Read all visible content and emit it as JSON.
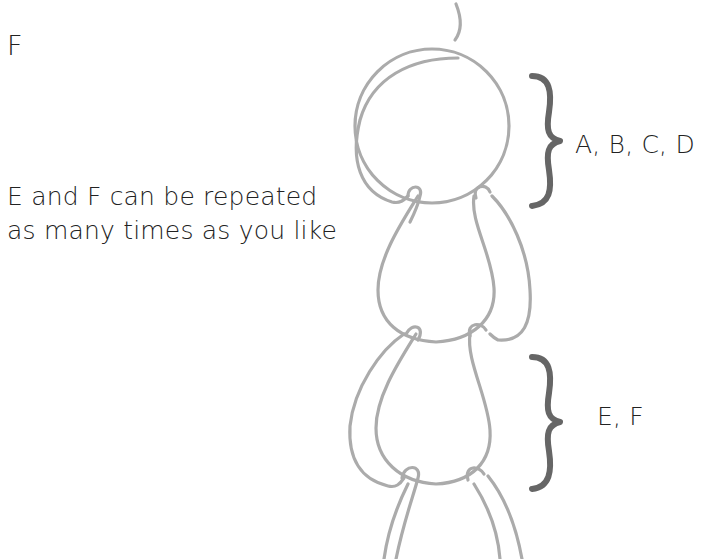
{
  "diagram": {
    "type": "crochet-chain-illustration",
    "labels": {
      "top_left": "F",
      "note_line1": "E and F can be repeated",
      "note_line2": "as many times as you like",
      "brace_top": "A, B, C, D",
      "brace_bottom": "E, F"
    },
    "colors": {
      "text": "#222222",
      "chain_stroke": "#ababab",
      "brace": "#666666",
      "background": "#ffffff"
    }
  }
}
